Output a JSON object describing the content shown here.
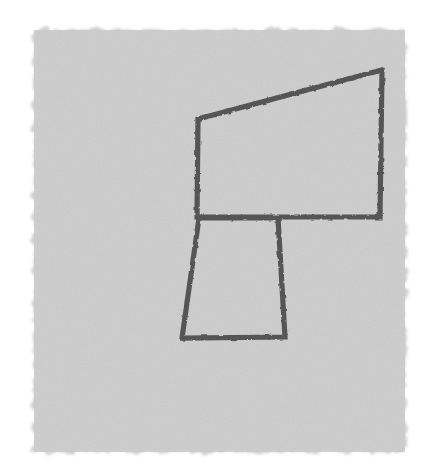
{
  "canvas": {
    "width": 429,
    "height": 475,
    "background_color": "#ffffff",
    "title": "Hand-drawn geometric line sketch"
  },
  "paper": {
    "name": "textured-gray-paper-patch",
    "fill_color": "#cdcdcd",
    "edge_style": "deckled-rough",
    "bounds": {
      "x": 34,
      "y": 30,
      "width": 371,
      "height": 422
    },
    "texture": "fine-grain-noise"
  },
  "drawing": {
    "stroke_color": "#555555",
    "stroke_width": 5.2,
    "line_cap": "square",
    "line_join": "miter",
    "shapes": [
      {
        "name": "upper-quadrilateral",
        "description": "Large quadrilateral with slanted top edge rising to the right",
        "closed": true,
        "points": [
          [
            198,
            119
          ],
          [
            382,
            70
          ],
          [
            380,
            217
          ],
          [
            197,
            217
          ]
        ]
      },
      {
        "name": "lower-trapezoid",
        "description": "Smaller trapezoid below-left, widening toward the bottom",
        "closed": true,
        "points": [
          [
            199,
            218
          ],
          [
            278,
            218
          ],
          [
            285,
            337
          ],
          [
            182,
            338
          ]
        ]
      }
    ]
  }
}
